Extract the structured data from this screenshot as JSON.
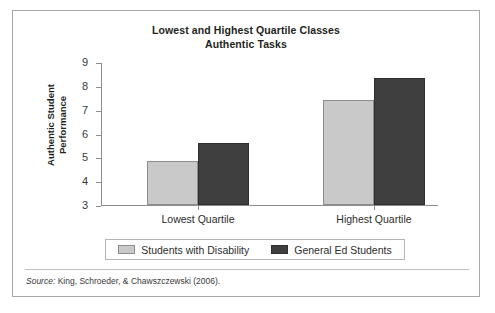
{
  "chart_data": {
    "type": "bar",
    "title": "Lowest and Highest Quartile Classes Authentic Tasks",
    "title_lines": [
      "Lowest and Highest Quartile Classes",
      "Authentic Tasks"
    ],
    "categories": [
      "Lowest Quartile",
      "Highest Quartile"
    ],
    "series": [
      {
        "name": "Students with Disability",
        "values": [
          4.85,
          7.4
        ],
        "color": "#c9c9c9"
      },
      {
        "name": "General Ed Students",
        "values": [
          5.6,
          8.35
        ],
        "color": "#3f3f3f"
      }
    ],
    "xlabel": "",
    "ylabel": "Authentic Student Performance",
    "ylabel_lines": [
      "Authentic Student",
      "Performance"
    ],
    "ylim": [
      3,
      9
    ],
    "yticks": [
      9,
      8,
      7,
      6,
      5,
      4,
      3
    ],
    "ytick_labels": [
      "9",
      "8",
      "7",
      "6",
      "5",
      "4",
      "3"
    ],
    "grid": false,
    "legend_position": "bottom"
  },
  "source": {
    "label": "Source:",
    "citation": " King, Schroeder, & Chawszczewski (2006)."
  },
  "colors": {
    "light_bar": "#c9c9c9",
    "dark_bar": "#3f3f3f",
    "axis": "#8d8d8d",
    "frame": "#a8a8a8",
    "text": "#231f20"
  }
}
